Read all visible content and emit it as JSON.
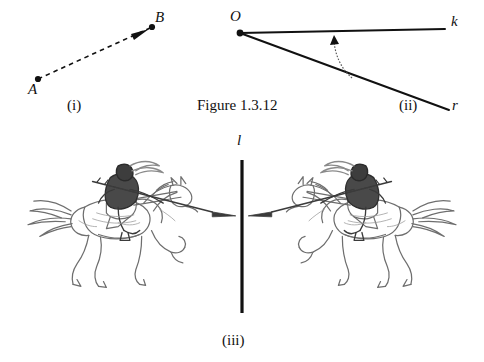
{
  "figure": {
    "caption": "Figure 1.3.12",
    "background_color": "#ffffff",
    "ink_color": "#111111",
    "sketch_color": "#808080"
  },
  "panels": [
    {
      "id": "i",
      "label": "(i)",
      "type": "directed-segment",
      "points": [
        {
          "name": "A",
          "label": "A",
          "x": 38,
          "y": 79
        },
        {
          "name": "B",
          "label": "B",
          "x": 152,
          "y": 27
        }
      ],
      "line_style": "dashed",
      "arrowhead_at": "B"
    },
    {
      "id": "ii",
      "label": "(ii)",
      "type": "angle",
      "vertex": {
        "name": "O",
        "label": "O",
        "x": 240,
        "y": 33
      },
      "rays": [
        {
          "name": "k",
          "label": "k",
          "end_x": 445,
          "end_y": 30
        },
        {
          "name": "r",
          "label": "r",
          "end_x": 448,
          "end_y": 108
        }
      ],
      "arc": {
        "direction": "counterclockwise",
        "arrowhead_at": "k"
      }
    },
    {
      "id": "iii",
      "label": "(iii)",
      "type": "reflection",
      "mirror_line": {
        "name": "l",
        "label": "l",
        "x": 242,
        "y_top": 160,
        "y_bottom": 313
      },
      "objects": [
        {
          "name": "knight-on-horseback-left",
          "facing": "right"
        },
        {
          "name": "knight-on-horseback-right",
          "facing": "left",
          "is_mirror_of": "knight-on-horseback-left"
        }
      ]
    }
  ]
}
